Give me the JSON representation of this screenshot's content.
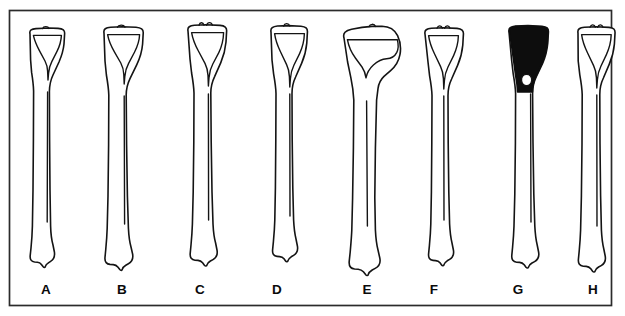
{
  "figure": {
    "background_color": "#ffffff",
    "ink_color": "#141414",
    "frame_color": "#2b2b2b",
    "highlight_fill_color": "#0d0d0d",
    "frame": {
      "x": 9,
      "y": 10,
      "width": 603,
      "height": 296
    },
    "specimen_count": 8
  },
  "specimens": [
    {
      "label": "A",
      "label_x": 46,
      "label_y": 289,
      "axis_x": 46,
      "top_y": 28,
      "bottom_y": 266,
      "plateau_width": 38,
      "shaft_width": 9,
      "proximal_fill": "outline",
      "note": "narrow plateau, slender shaft"
    },
    {
      "label": "B",
      "label_x": 122,
      "label_y": 289,
      "axis_x": 124,
      "top_y": 27,
      "bottom_y": 268,
      "plateau_width": 42,
      "shaft_width": 10,
      "proximal_fill": "outline",
      "note": "broad plateau, robust shaft"
    },
    {
      "label": "C",
      "label_x": 200,
      "label_y": 289,
      "axis_x": 206,
      "top_y": 25,
      "bottom_y": 263,
      "plateau_width": 40,
      "shaft_width": 9,
      "proximal_fill": "outline",
      "note": "tall intercondylar eminence"
    },
    {
      "label": "D",
      "label_x": 277,
      "label_y": 289,
      "axis_x": 288,
      "top_y": 26,
      "bottom_y": 258,
      "plateau_width": 38,
      "shaft_width": 9,
      "proximal_fill": "outline",
      "note": "shortest element"
    },
    {
      "label": "E",
      "label_x": 367,
      "label_y": 289,
      "axis_x": 374,
      "top_y": 26,
      "bottom_y": 270,
      "plateau_width": 56,
      "shaft_width": 12,
      "proximal_fill": "outline",
      "note": "asymmetric expanded proximal end, largest specimen"
    },
    {
      "label": "F",
      "label_x": 434,
      "label_y": 289,
      "axis_x": 443,
      "top_y": 28,
      "bottom_y": 263,
      "plateau_width": 40,
      "shaft_width": 9,
      "proximal_fill": "outline",
      "note": "standard form"
    },
    {
      "label": "G",
      "label_x": 518,
      "label_y": 289,
      "axis_x": 528,
      "top_y": 26,
      "bottom_y": 266,
      "plateau_width": 42,
      "shaft_width": 8,
      "proximal_fill": "solid-black",
      "note": "proximal epiphysis shaded solid black"
    },
    {
      "label": "H",
      "label_x": 593,
      "label_y": 289,
      "axis_x": 596,
      "top_y": 27,
      "bottom_y": 270,
      "plateau_width": 38,
      "shaft_width": 9,
      "proximal_fill": "outline",
      "note": "slender, straight shaft"
    }
  ],
  "labels": {
    "a": "A",
    "b": "B",
    "c": "C",
    "d": "D",
    "e": "E",
    "f": "F",
    "g": "G",
    "h": "H"
  }
}
